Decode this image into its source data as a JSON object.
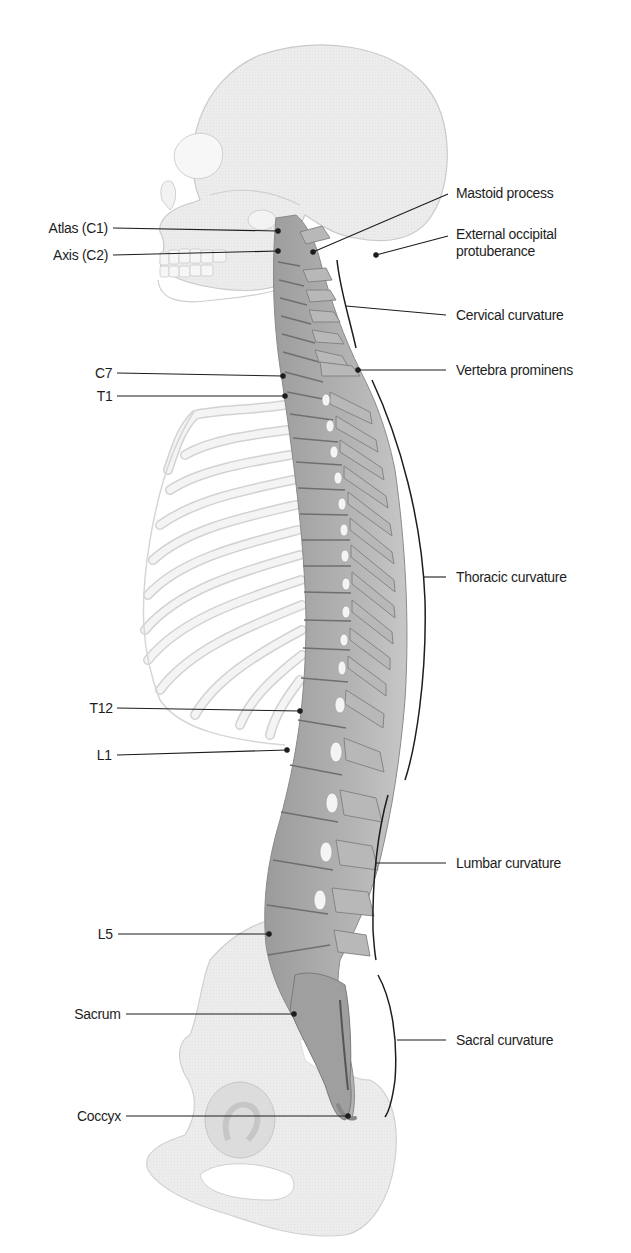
{
  "diagram": {
    "labels_left": [
      {
        "id": "atlas",
        "text": "Atlas (C1)",
        "x": 108,
        "y": 228,
        "tx": 278,
        "ty": 231
      },
      {
        "id": "axis",
        "text": "Axis (C2)",
        "x": 108,
        "y": 255,
        "tx": 278,
        "ty": 251
      },
      {
        "id": "c7",
        "text": "C7",
        "x": 108,
        "y": 373,
        "tx": 283,
        "ty": 376
      },
      {
        "id": "t1",
        "text": "T1",
        "x": 108,
        "y": 396,
        "tx": 285,
        "ty": 396
      },
      {
        "id": "t12",
        "text": "T12",
        "x": 108,
        "y": 708,
        "tx": 300,
        "ty": 711
      },
      {
        "id": "l1",
        "text": "L1",
        "x": 108,
        "y": 755,
        "tx": 287,
        "ty": 750
      },
      {
        "id": "l5",
        "text": "L5",
        "x": 108,
        "y": 935,
        "tx": 269,
        "ty": 934
      },
      {
        "id": "sacrum",
        "text": "Sacrum",
        "x": 108,
        "y": 1014,
        "tx": 294,
        "ty": 1014
      },
      {
        "id": "coccyx",
        "text": "Coccyx",
        "x": 108,
        "y": 1117,
        "tx": 348,
        "ty": 1116
      }
    ],
    "labels_right": [
      {
        "id": "mastoid-process",
        "text": "Mastoid process",
        "x": 445,
        "y": 193,
        "tx": 313,
        "ty": 252
      },
      {
        "id": "external-occipital-protuberance",
        "text": [
          "External occipital",
          "protuberance"
        ],
        "x": 445,
        "y": 238,
        "tx": 376,
        "ty": 255
      },
      {
        "id": "cervical-curvature",
        "text": "Cervical curvature",
        "x": 445,
        "y": 315,
        "tx": 346,
        "ty": 306
      },
      {
        "id": "vertebra-prominens",
        "text": "Vertebra prominens",
        "x": 445,
        "y": 370,
        "tx": 358,
        "ty": 370
      },
      {
        "id": "thoracic-curvature",
        "text": "Thoracic curvature",
        "x": 445,
        "y": 577,
        "tx": 424,
        "ty": 577
      },
      {
        "id": "lumbar-curvature",
        "text": "Lumbar curvature",
        "x": 445,
        "y": 863,
        "tx": 376,
        "ty": 863
      },
      {
        "id": "sacral-curvature",
        "text": "Sacral curvature",
        "x": 445,
        "y": 1040,
        "tx": 397,
        "ty": 1040
      }
    ],
    "colors": {
      "bone_light": "#efefef",
      "bone_outline": "#c8c8c8",
      "spine_fill": "#a9a9a9",
      "spine_dark": "#7d7d7d",
      "leader_line": "#1d1d1d",
      "label_text": "#1d1d1d"
    }
  }
}
